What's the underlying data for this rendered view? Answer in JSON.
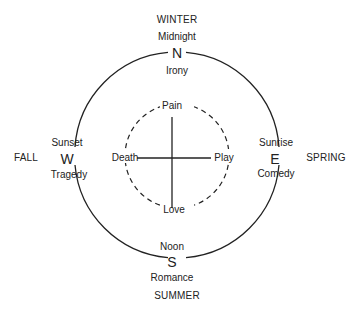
{
  "diagram": {
    "seasons": {
      "north": "WINTER",
      "west": "FALL",
      "east": "SPRING",
      "south": "SUMMER"
    },
    "compass": {
      "north": {
        "letter": "N",
        "time": "Midnight",
        "mode": "Irony"
      },
      "west": {
        "letter": "W",
        "time": "Sunset",
        "mode": "Tragedy"
      },
      "east": {
        "letter": "E",
        "time": "Sunrise",
        "mode": "Comedy"
      },
      "south": {
        "letter": "S",
        "time": "Noon",
        "mode": "Romance"
      }
    },
    "inner": {
      "top": "Pain",
      "left": "Death",
      "right": "Play",
      "bottom": "Love"
    },
    "colors": {
      "line": "#222222",
      "background": "#ffffff"
    }
  }
}
